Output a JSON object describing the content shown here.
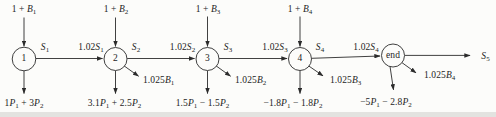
{
  "figure": {
    "type": "network-flow-diagram",
    "colors": {
      "ink": "#2b2b2b",
      "background": "#fcfcfa",
      "scan_edge": "#e3e3e0"
    },
    "nodes": [
      {
        "id": "1",
        "label": "1"
      },
      {
        "id": "2",
        "label": "2"
      },
      {
        "id": "3",
        "label": "3"
      },
      {
        "id": "4",
        "label": "4"
      },
      {
        "id": "end",
        "label": "end"
      }
    ],
    "labels": {
      "inflow": [
        {
          "text": "1 + B₁",
          "segments": [
            {
              "t": "1 + "
            },
            {
              "t": "B",
              "v": 1
            },
            {
              "t": "1",
              "s": 1
            }
          ]
        },
        {
          "text": "1 + B₂",
          "segments": [
            {
              "t": "1 + "
            },
            {
              "t": "B",
              "v": 1
            },
            {
              "t": "2",
              "s": 1
            }
          ]
        },
        {
          "text": "1 + B₃",
          "segments": [
            {
              "t": "1 + "
            },
            {
              "t": "B",
              "v": 1
            },
            {
              "t": "3",
              "s": 1
            }
          ]
        },
        {
          "text": "1 + B₄",
          "segments": [
            {
              "t": "1 + "
            },
            {
              "t": "B",
              "v": 1
            },
            {
              "t": "4",
              "s": 1
            }
          ]
        }
      ],
      "surplus": [
        {
          "text": "S₁",
          "segments": [
            {
              "t": "S",
              "v": 1
            },
            {
              "t": "1",
              "s": 1
            }
          ]
        },
        {
          "text": "S₂",
          "segments": [
            {
              "t": "S",
              "v": 1
            },
            {
              "t": "2",
              "s": 1
            }
          ]
        },
        {
          "text": "S₃",
          "segments": [
            {
              "t": "S",
              "v": 1
            },
            {
              "t": "3",
              "s": 1
            }
          ]
        },
        {
          "text": "S₄",
          "segments": [
            {
              "t": "S",
              "v": 1
            },
            {
              "t": "4",
              "s": 1
            }
          ]
        },
        {
          "text": "S₅",
          "segments": [
            {
              "t": "S",
              "v": 1
            },
            {
              "t": "5",
              "s": 1
            }
          ]
        }
      ],
      "grown": [
        {
          "text": "1.02S₁",
          "segments": [
            {
              "t": "1.02"
            },
            {
              "t": "S",
              "v": 1
            },
            {
              "t": "1",
              "s": 1
            }
          ]
        },
        {
          "text": "1.02S₂",
          "segments": [
            {
              "t": "1.02"
            },
            {
              "t": "S",
              "v": 1
            },
            {
              "t": "2",
              "s": 1
            }
          ]
        },
        {
          "text": "1.02S₃",
          "segments": [
            {
              "t": "1.02"
            },
            {
              "t": "S",
              "v": 1
            },
            {
              "t": "3",
              "s": 1
            }
          ]
        },
        {
          "text": "1.02S₄",
          "segments": [
            {
              "t": "1.02"
            },
            {
              "t": "S",
              "v": 1
            },
            {
              "t": "4",
              "s": 1
            }
          ]
        }
      ],
      "repay": [
        {
          "text": "1.025B₁",
          "segments": [
            {
              "t": "1.025"
            },
            {
              "t": "B",
              "v": 1
            },
            {
              "t": "1",
              "s": 1
            }
          ]
        },
        {
          "text": "1.025B₂",
          "segments": [
            {
              "t": "1.025"
            },
            {
              "t": "B",
              "v": 1
            },
            {
              "t": "2",
              "s": 1
            }
          ]
        },
        {
          "text": "1.025B₃",
          "segments": [
            {
              "t": "1.025"
            },
            {
              "t": "B",
              "v": 1
            },
            {
              "t": "3",
              "s": 1
            }
          ]
        },
        {
          "text": "1.025B₄",
          "segments": [
            {
              "t": "1.025"
            },
            {
              "t": "B",
              "v": 1
            },
            {
              "t": "4",
              "s": 1
            }
          ]
        }
      ],
      "payout": [
        {
          "text": "1P₁ + 3P₂",
          "segments": [
            {
              "t": "1"
            },
            {
              "t": "P",
              "v": 1
            },
            {
              "t": "1",
              "s": 1
            },
            {
              "t": " + 3"
            },
            {
              "t": "P",
              "v": 1
            },
            {
              "t": "2",
              "s": 1
            }
          ]
        },
        {
          "text": "3.1P₁ + 2.5P₂",
          "segments": [
            {
              "t": "3.1"
            },
            {
              "t": "P",
              "v": 1
            },
            {
              "t": "1",
              "s": 1
            },
            {
              "t": " + 2.5"
            },
            {
              "t": "P",
              "v": 1
            },
            {
              "t": "2",
              "s": 1
            }
          ]
        },
        {
          "text": "1.5P₁ − 1.5P₂",
          "segments": [
            {
              "t": "1.5"
            },
            {
              "t": "P",
              "v": 1
            },
            {
              "t": "1",
              "s": 1
            },
            {
              "t": " − 1.5"
            },
            {
              "t": "P",
              "v": 1
            },
            {
              "t": "2",
              "s": 1
            }
          ]
        },
        {
          "text": "−1.8P₁ − 1.8P₂",
          "segments": [
            {
              "t": "−1.8"
            },
            {
              "t": "P",
              "v": 1
            },
            {
              "t": "1",
              "s": 1
            },
            {
              "t": " − 1.8"
            },
            {
              "t": "P",
              "v": 1
            },
            {
              "t": "2",
              "s": 1
            }
          ]
        },
        {
          "text": "−5P₁ − 2.8P₂",
          "segments": [
            {
              "t": "−5"
            },
            {
              "t": "P",
              "v": 1
            },
            {
              "t": "1",
              "s": 1
            },
            {
              "t": " − 2.8"
            },
            {
              "t": "P",
              "v": 1
            },
            {
              "t": "2",
              "s": 1
            }
          ]
        }
      ]
    },
    "edges": [
      {
        "from": "outside",
        "to": "1",
        "direction": "down",
        "label": "1 + B₁"
      },
      {
        "from": "outside",
        "to": "2",
        "direction": "down",
        "label": "1 + B₂"
      },
      {
        "from": "outside",
        "to": "3",
        "direction": "down",
        "label": "1 + B₃"
      },
      {
        "from": "outside",
        "to": "4",
        "direction": "down",
        "label": "1 + B₄"
      },
      {
        "from": "1",
        "to": "2",
        "direction": "right",
        "tail_label": "S₁",
        "head_label": "1.02S₁"
      },
      {
        "from": "2",
        "to": "3",
        "direction": "right",
        "tail_label": "S₂",
        "head_label": "1.02S₂"
      },
      {
        "from": "3",
        "to": "4",
        "direction": "right",
        "tail_label": "S₃",
        "head_label": "1.02S₃"
      },
      {
        "from": "4",
        "to": "end",
        "direction": "right",
        "tail_label": "S₄",
        "head_label": "1.02S₄"
      },
      {
        "from": "end",
        "to": "outside",
        "direction": "right",
        "label": "S₅"
      },
      {
        "from": "2",
        "to": "outside",
        "direction": "down-right",
        "label": "1.025B₁"
      },
      {
        "from": "3",
        "to": "outside",
        "direction": "down-right",
        "label": "1.025B₂"
      },
      {
        "from": "4",
        "to": "outside",
        "direction": "down-right",
        "label": "1.025B₃"
      },
      {
        "from": "end",
        "to": "outside",
        "direction": "down-right",
        "label": "1.025B₄"
      },
      {
        "from": "1",
        "to": "outside",
        "direction": "down",
        "label": "1P₁ + 3P₂"
      },
      {
        "from": "2",
        "to": "outside",
        "direction": "down",
        "label": "3.1P₁ + 2.5P₂"
      },
      {
        "from": "3",
        "to": "outside",
        "direction": "down",
        "label": "1.5P₁ − 1.5P₂"
      },
      {
        "from": "4",
        "to": "outside",
        "direction": "down",
        "label": "−1.8P₁ − 1.8P₂"
      },
      {
        "from": "end",
        "to": "outside",
        "direction": "down",
        "label": "−5P₁ − 2.8P₂"
      }
    ]
  }
}
